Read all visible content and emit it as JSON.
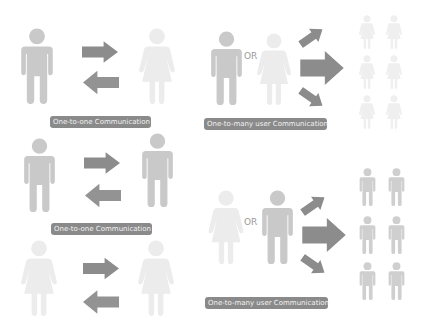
{
  "panels": [
    {
      "id": "one-to-one-male-female",
      "label": "One-to-one Communication",
      "sender": "male",
      "receiver": "female",
      "arrows": [
        "right",
        "left"
      ]
    },
    {
      "id": "one-to-many-female-receivers",
      "label": "One-to-many user Communication",
      "senders": [
        "male",
        "female"
      ],
      "connector": "OR",
      "arrows": [
        "up-right",
        "right",
        "down-right"
      ],
      "receivers": [
        "female",
        "female",
        "female",
        "female",
        "female",
        "female"
      ]
    },
    {
      "id": "one-to-one-male-male",
      "label": "One-to-one Communication",
      "sender": "male",
      "receiver": "male",
      "arrows": [
        "right",
        "left"
      ]
    },
    {
      "id": "one-to-one-female-female",
      "label": "",
      "sender": "female",
      "receiver": "female",
      "arrows": [
        "right",
        "left"
      ]
    },
    {
      "id": "one-to-many-male-receivers",
      "label": "One-to-many user Communication",
      "senders": [
        "female",
        "male"
      ],
      "connector": "OR",
      "arrows": [
        "up-right",
        "right",
        "down-right"
      ],
      "receivers": [
        "male",
        "male",
        "male",
        "male",
        "male",
        "male"
      ]
    }
  ],
  "icons": {
    "male": "male-person-icon",
    "female": "female-person-icon",
    "arrow": "arrow-icon"
  },
  "colors": {
    "male": "#c9c9c9",
    "female": "#ececec",
    "arrow": "#8c8c8c",
    "label_bg": "#8a8a8a",
    "label_text": "#f2f2f2"
  }
}
